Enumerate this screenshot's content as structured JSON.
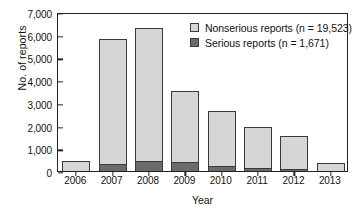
{
  "chart_data": {
    "type": "bar",
    "stacked": true,
    "title": "",
    "xlabel": "Year",
    "ylabel": "No. of reports",
    "categories": [
      "2006",
      "2007",
      "2008",
      "2009",
      "2010",
      "2011",
      "2012",
      "2013"
    ],
    "series": [
      {
        "name": "Serious reports (n = 1,671)",
        "color": "#6b6b6b",
        "values": [
          20,
          310,
          440,
          400,
          200,
          140,
          90,
          15
        ]
      },
      {
        "name": "Nonserious reports (n = 19,523)",
        "color": "#d6d6d4",
        "values": [
          430,
          5540,
          5910,
          3190,
          2510,
          1850,
          1520,
          370
        ]
      }
    ],
    "totals": [
      450,
      5850,
      6350,
      3590,
      2710,
      1990,
      1610,
      385
    ],
    "ylim": [
      0,
      7000
    ],
    "yticks": [
      0,
      1000,
      2000,
      3000,
      4000,
      5000,
      6000,
      7000
    ],
    "ytick_labels": [
      "0",
      "1,000",
      "2,000",
      "3,000",
      "4,000",
      "5,000",
      "6,000",
      "7,000"
    ],
    "grid": false,
    "legend_position": "top-right"
  },
  "axes": {
    "y_title": "No. of reports",
    "x_title": "Year"
  },
  "legend": {
    "entries": [
      {
        "label": "Nonserious reports (n = 19,523)",
        "swatch": "nonserious-swatch"
      },
      {
        "label": "Serious reports (n = 1,671)",
        "swatch": "serious-swatch"
      }
    ]
  },
  "colors": {
    "nonserious": "#d6d6d4",
    "serious": "#6b6b6b",
    "axis": "#222222",
    "background": "#ffffff"
  }
}
